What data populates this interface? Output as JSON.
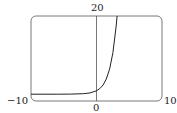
{
  "chart_data": {
    "type": "line",
    "title": "",
    "xlabel": "",
    "ylabel": "",
    "xlim": [
      -10,
      10
    ],
    "ylim": [
      -5,
      20
    ],
    "grid": false,
    "tick_labels": {
      "x_min": "−10",
      "x_max": "10",
      "x_zero": "0",
      "y_max": "20"
    },
    "series": [
      {
        "name": "curve",
        "x": [
          -10,
          -8,
          -6,
          -4,
          -2,
          -1,
          0,
          0.5,
          1,
          1.5,
          2,
          2.5,
          3,
          3.14
        ],
        "y": [
          -3.0,
          -3.0,
          -3.0,
          -2.98,
          -2.86,
          -2.63,
          -2.0,
          -1.35,
          -0.28,
          1.48,
          4.39,
          9.18,
          17.09,
          20.0
        ]
      }
    ],
    "colors": {
      "curve": "#222222",
      "frame": "#555555",
      "axis": "#555555"
    }
  }
}
